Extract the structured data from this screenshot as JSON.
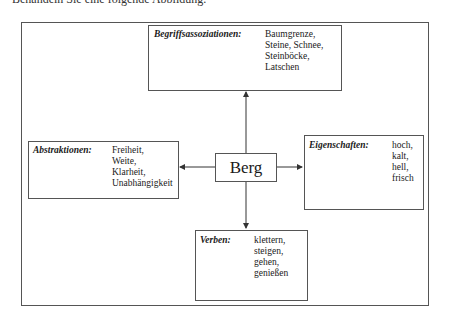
{
  "intro_text": "Behandeln Sie eine folgende Abbildung.",
  "diagram": {
    "center": "Berg",
    "top": {
      "label": "Begriffsassoziationen:",
      "items": [
        "Baumgrenze,",
        "Steine, Schnee,",
        "Steinböcke,",
        "Latschen"
      ]
    },
    "left": {
      "label": "Abstraktionen:",
      "items": [
        "Freiheit,",
        "Weite,",
        "Klarheit,",
        "Unabhängigkeit"
      ]
    },
    "right": {
      "label": "Eigenschaften:",
      "items": [
        "hoch,",
        "kalt,",
        "hell,",
        "frisch"
      ]
    },
    "bottom": {
      "label": "Verben:",
      "items": [
        "klettern,",
        "steigen,",
        "gehen,",
        "genießen"
      ]
    }
  }
}
